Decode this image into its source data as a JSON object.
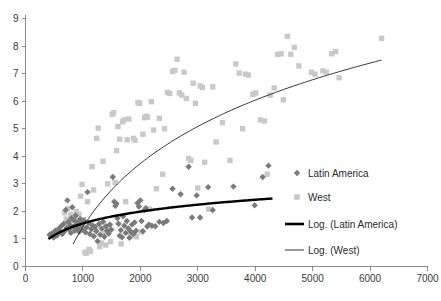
{
  "chart_data": {
    "type": "scatter",
    "title": "",
    "xlabel": "",
    "ylabel": "",
    "xlim": [
      0,
      7000
    ],
    "ylim": [
      0,
      9
    ],
    "xticks": [
      0,
      1000,
      2000,
      3000,
      4000,
      5000,
      6000,
      7000
    ],
    "yticks": [
      0,
      1,
      2,
      3,
      4,
      5,
      6,
      7,
      8,
      9
    ],
    "grid": false,
    "legend_position": "right",
    "colors": {
      "latin_america_marker": "#7a7a7a",
      "west_marker": "#c9c9c9",
      "latin_america_line": "#000000",
      "west_line": "#333333",
      "axis": "#8c8c8c",
      "text": "#3a3a3a",
      "background": "#ffffff"
    },
    "legend": [
      {
        "label": "Latin America",
        "marker": "diamond",
        "color": "#7a7a7a"
      },
      {
        "label": "West",
        "marker": "square",
        "color": "#c9c9c9"
      },
      {
        "label": "Log. (Latin America)",
        "marker": "thick-line",
        "color": "#000000"
      },
      {
        "label": "Log. (West)",
        "marker": "thin-line",
        "color": "#333333"
      }
    ],
    "series": [
      {
        "name": "Latin America",
        "marker": "diamond",
        "color": "#7a7a7a",
        "points": [
          [
            420,
            1.15
          ],
          [
            460,
            1.2
          ],
          [
            490,
            1.05
          ],
          [
            520,
            1.3
          ],
          [
            545,
            1.12
          ],
          [
            570,
            1.35
          ],
          [
            600,
            1.25
          ],
          [
            615,
            1.45
          ],
          [
            640,
            1.18
          ],
          [
            665,
            1.55
          ],
          [
            680,
            1.28
          ],
          [
            700,
            2.05
          ],
          [
            715,
            1.4
          ],
          [
            730,
            2.4
          ],
          [
            745,
            1.62
          ],
          [
            760,
            1.35
          ],
          [
            775,
            1.5
          ],
          [
            790,
            1.22
          ],
          [
            800,
            1.75
          ],
          [
            815,
            2.15
          ],
          [
            830,
            1.44
          ],
          [
            845,
            1.68
          ],
          [
            860,
            1.3
          ],
          [
            875,
            1.85
          ],
          [
            890,
            1.52
          ],
          [
            905,
            1.38
          ],
          [
            920,
            1.6
          ],
          [
            935,
            1.26
          ],
          [
            950,
            1.72
          ],
          [
            965,
            1.48
          ],
          [
            980,
            1.56
          ],
          [
            1000,
            1.33
          ],
          [
            1020,
            1.66
          ],
          [
            1045,
            1.24
          ],
          [
            1065,
            1.42
          ],
          [
            1080,
            2.7
          ],
          [
            1100,
            1.58
          ],
          [
            1120,
            1.18
          ],
          [
            1145,
            1.36
          ],
          [
            1165,
            1.5
          ],
          [
            1190,
            1.1
          ],
          [
            1210,
            1.44
          ],
          [
            1235,
            1.28
          ],
          [
            1255,
            0.92
          ],
          [
            1280,
            1.54
          ],
          [
            1300,
            1.15
          ],
          [
            1325,
            1.38
          ],
          [
            1350,
            1.62
          ],
          [
            1375,
            1.08
          ],
          [
            1400,
            1.46
          ],
          [
            1420,
            1.3
          ],
          [
            1450,
            1.2
          ],
          [
            1470,
            1.52
          ],
          [
            1495,
            1.34
          ],
          [
            1520,
            3.25
          ],
          [
            1545,
            2.35
          ],
          [
            1565,
            2.2
          ],
          [
            1585,
            2.28
          ],
          [
            1600,
            1.75
          ],
          [
            1620,
            1.55
          ],
          [
            1640,
            1.12
          ],
          [
            1660,
            1.32
          ],
          [
            1680,
            1.06
          ],
          [
            1700,
            1.82
          ],
          [
            1720,
            1.48
          ],
          [
            1745,
            1.22
          ],
          [
            1765,
            1.65
          ],
          [
            1790,
            1.38
          ],
          [
            1810,
            1.04
          ],
          [
            1835,
            1.26
          ],
          [
            1855,
            1.52
          ],
          [
            1880,
            1.18
          ],
          [
            1900,
            1.6
          ],
          [
            1925,
            1.3
          ],
          [
            1950,
            2.3
          ],
          [
            1975,
            2.18
          ],
          [
            2000,
            2.4
          ],
          [
            2020,
            1.65
          ],
          [
            2045,
            1.28
          ],
          [
            2070,
            2.05
          ],
          [
            2095,
            2.12
          ],
          [
            2120,
            1.45
          ],
          [
            2150,
            1.52
          ],
          [
            2200,
            1.48
          ],
          [
            2260,
            1.46
          ],
          [
            2330,
            1.62
          ],
          [
            2400,
            1.58
          ],
          [
            2460,
            1.65
          ],
          [
            2560,
            2.82
          ],
          [
            2700,
            2.62
          ],
          [
            2840,
            3.62
          ],
          [
            2900,
            1.78
          ],
          [
            2980,
            2.58
          ],
          [
            3040,
            1.78
          ],
          [
            3180,
            2.88
          ],
          [
            3260,
            2.05
          ],
          [
            3620,
            2.9
          ],
          [
            3990,
            2.22
          ],
          [
            4130,
            3.25
          ],
          [
            4230,
            3.66
          ]
        ]
      },
      {
        "name": "West",
        "marker": "square",
        "color": "#c9c9c9",
        "points": [
          [
            680,
            1.95
          ],
          [
            710,
            1.72
          ],
          [
            735,
            2.1
          ],
          [
            760,
            1.58
          ],
          [
            790,
            1.88
          ],
          [
            810,
            1.66
          ],
          [
            835,
            1.8
          ],
          [
            860,
            1.74
          ],
          [
            885,
            2.0
          ],
          [
            905,
            1.62
          ],
          [
            930,
            1.9
          ],
          [
            960,
            2.55
          ],
          [
            985,
            2.98
          ],
          [
            1010,
            1.7
          ],
          [
            1035,
            0.52
          ],
          [
            1055,
            0.48
          ],
          [
            1080,
            2.35
          ],
          [
            1105,
            0.62
          ],
          [
            1130,
            0.55
          ],
          [
            1160,
            3.62
          ],
          [
            1185,
            2.78
          ],
          [
            1210,
            1.34
          ],
          [
            1240,
            4.65
          ],
          [
            1265,
            5.02
          ],
          [
            1290,
            0.72
          ],
          [
            1320,
            0.85
          ],
          [
            1350,
            3.82
          ],
          [
            1375,
            1.25
          ],
          [
            1400,
            0.78
          ],
          [
            1430,
            3.0
          ],
          [
            1455,
            1.4
          ],
          [
            1480,
            0.9
          ],
          [
            1510,
            5.52
          ],
          [
            1535,
            5.58
          ],
          [
            1560,
            3.05
          ],
          [
            1585,
            4.2
          ],
          [
            1610,
            5.08
          ],
          [
            1640,
            4.62
          ],
          [
            1665,
            0.82
          ],
          [
            1690,
            5.25
          ],
          [
            1715,
            5.32
          ],
          [
            1745,
            2.35
          ],
          [
            1770,
            4.6
          ],
          [
            1800,
            5.35
          ],
          [
            1825,
            1.1
          ],
          [
            1850,
            1.22
          ],
          [
            1880,
            4.65
          ],
          [
            1905,
            4.58
          ],
          [
            1930,
            1.08
          ],
          [
            1960,
            5.95
          ],
          [
            1990,
            5.92
          ],
          [
            2015,
            1.26
          ],
          [
            2045,
            4.8
          ],
          [
            2075,
            5.4
          ],
          [
            2100,
            5.45
          ],
          [
            2125,
            5.42
          ],
          [
            2160,
            2.08
          ],
          [
            2190,
            5.98
          ],
          [
            2230,
            4.95
          ],
          [
            2280,
            2.82
          ],
          [
            2330,
            5.38
          ],
          [
            2390,
            3.35
          ],
          [
            2420,
            5.0
          ],
          [
            2470,
            6.32
          ],
          [
            2510,
            6.28
          ],
          [
            2560,
            7.08
          ],
          [
            2600,
            7.12
          ],
          [
            2640,
            7.52
          ],
          [
            2680,
            6.3
          ],
          [
            2720,
            6.22
          ],
          [
            2760,
            7.05
          ],
          [
            2800,
            6.1
          ],
          [
            2840,
            3.92
          ],
          [
            2880,
            3.85
          ],
          [
            2920,
            6.65
          ],
          [
            2960,
            5.92
          ],
          [
            3000,
            2.85
          ],
          [
            3040,
            6.55
          ],
          [
            3080,
            6.5
          ],
          [
            3120,
            3.78
          ],
          [
            3190,
            2.08
          ],
          [
            3260,
            6.52
          ],
          [
            3320,
            4.52
          ],
          [
            3430,
            5.22
          ],
          [
            3560,
            3.85
          ],
          [
            3660,
            7.35
          ],
          [
            3720,
            7.02
          ],
          [
            3780,
            5.0
          ],
          [
            3830,
            6.98
          ],
          [
            3880,
            6.95
          ],
          [
            3960,
            6.25
          ],
          [
            4010,
            6.3
          ],
          [
            4090,
            5.32
          ],
          [
            4160,
            5.28
          ],
          [
            4210,
            3.35
          ],
          [
            4260,
            6.22
          ],
          [
            4330,
            6.48
          ],
          [
            4390,
            7.7
          ],
          [
            4450,
            7.72
          ],
          [
            4490,
            6.05
          ],
          [
            4560,
            8.35
          ],
          [
            4620,
            7.7
          ],
          [
            4680,
            7.95
          ],
          [
            4760,
            7.28
          ],
          [
            4980,
            7.05
          ],
          [
            5040,
            6.98
          ],
          [
            5180,
            7.1
          ],
          [
            5240,
            7.05
          ],
          [
            5330,
            7.72
          ],
          [
            5400,
            7.8
          ],
          [
            5460,
            6.85
          ],
          [
            6200,
            8.28
          ]
        ]
      }
    ],
    "trendlines": [
      {
        "name": "Log. (Latin America)",
        "style": "thick",
        "color": "#000000",
        "x_start": 400,
        "x_end": 4300,
        "a": 0.62,
        "b": -2.72
      },
      {
        "name": "Log. (West)",
        "style": "thin",
        "color": "#333333",
        "x_start": 830,
        "x_end": 6200,
        "a": 3.32,
        "b": -21.5
      }
    ]
  }
}
